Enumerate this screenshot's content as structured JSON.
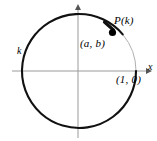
{
  "figure": {
    "kind": "unit-circle-diagram",
    "background_color": "#ffffff",
    "axis_color": "#9a9a9a",
    "curve_color": "#111111",
    "thin_arc_color": "#aaaaaa",
    "point_color": "#000000",
    "labels": {
      "point_p": "P(k)",
      "coordinates": "(a, b)",
      "initial_point": "(1, 0)",
      "arc_length": "k",
      "x_axis": "x"
    },
    "geometry": {
      "center_x": 79,
      "center_y": 71,
      "radius": 57,
      "point_p_x": 112,
      "point_p_y": 33,
      "point_p_angle_deg": 40,
      "x_axis_y": 71,
      "x_axis_start": 12,
      "x_axis_end": 150,
      "y_axis_x": 78,
      "y_axis_start": 5,
      "y_axis_end": 138
    }
  }
}
